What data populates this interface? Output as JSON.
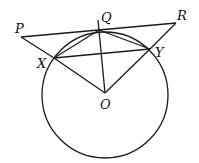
{
  "diagram": {
    "type": "geometry",
    "stroke_color": "#1a1a1a",
    "circle": {
      "center": "O",
      "cx": 105,
      "cy": 95,
      "r": 63
    },
    "points": {
      "P": {
        "x": 21,
        "y": 37,
        "label": "P",
        "lx": 15,
        "ly": 33
      },
      "Q": {
        "x": 99,
        "y": 30,
        "label": "Q",
        "lx": 100,
        "ly": 22
      },
      "R": {
        "x": 176,
        "y": 23,
        "label": "R",
        "lx": 177,
        "ly": 20
      },
      "X": {
        "x": 54,
        "y": 58,
        "label": "X",
        "lx": 36,
        "ly": 67
      },
      "Y": {
        "x": 150,
        "y": 49,
        "label": "Y",
        "lx": 155,
        "ly": 55
      },
      "O": {
        "x": 105,
        "y": 93,
        "label": "O",
        "lx": 100,
        "ly": 109
      }
    },
    "segments": [
      [
        "P",
        "R"
      ],
      [
        "P",
        "X"
      ],
      [
        "X",
        "O"
      ],
      [
        "R",
        "Y"
      ],
      [
        "Y",
        "O"
      ],
      [
        "X",
        "Y"
      ],
      [
        "X",
        "Q"
      ],
      [
        "Q",
        "Y"
      ],
      [
        "Q",
        "O"
      ]
    ]
  }
}
